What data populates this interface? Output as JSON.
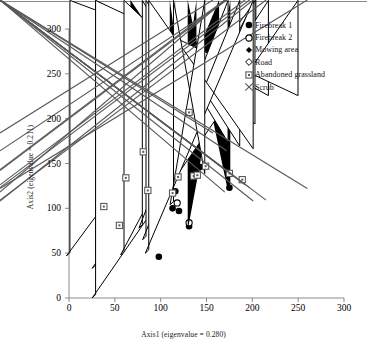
{
  "figure": {
    "background_color": "#ffffff",
    "frame_color": "#808080"
  },
  "axes": {
    "x": {
      "title": "Axis1 (eigenvalue = 0.280)",
      "ticks": [
        0,
        50,
        100,
        150,
        200,
        250,
        300
      ],
      "tick_labels": [
        "0",
        "50",
        "100",
        "150",
        "200",
        "250",
        "300"
      ],
      "range": [
        0,
        300
      ]
    },
    "y": {
      "title": "Axis2 (eigenvalue = 0.211)",
      "ticks": [
        0,
        50,
        100,
        150,
        200,
        250,
        300
      ],
      "tick_labels": [
        "0",
        "50",
        "100",
        "150",
        "200",
        "250",
        "300"
      ],
      "range": [
        0,
        300
      ]
    }
  },
  "legend": {
    "position": "top-right",
    "entries": [
      {
        "label": "Firebreak 1",
        "marker": "filled-circle"
      },
      {
        "label": "Firebreak 2",
        "marker": "open-circle"
      },
      {
        "label": "Mowing area",
        "marker": "filled-diamond"
      },
      {
        "label": "Road",
        "marker": "open-diamond"
      },
      {
        "label": "Abandoned grassland",
        "marker": "dotted-square"
      },
      {
        "label": "Scrub",
        "marker": "cross-x"
      }
    ]
  },
  "chart_data": {
    "type": "scatter",
    "title": "",
    "xlabel": "Axis1 (eigenvalue = 0.280)",
    "ylabel": "Axis2 (eigenvalue = 0.211)",
    "xlim": [
      0,
      300
    ],
    "ylim": [
      0,
      300
    ],
    "grid": false,
    "legend_position": "top-right",
    "series": [
      {
        "name": "Firebreak 1",
        "marker": "filled-circle",
        "color": "#000000",
        "points": [
          [
            28,
            242
          ],
          [
            31,
            139
          ],
          [
            39,
            143
          ],
          [
            50,
            164
          ],
          [
            51,
            140
          ],
          [
            64,
            151
          ],
          [
            65,
            147
          ],
          [
            66,
            143
          ],
          [
            75,
            138
          ],
          [
            87,
            173
          ],
          [
            88,
            165
          ],
          [
            98,
            46
          ],
          [
            116,
            119
          ],
          [
            113,
            100
          ],
          [
            120,
            97
          ],
          [
            131,
            80
          ],
          [
            140,
            144
          ],
          [
            143,
            146
          ],
          [
            175,
            123
          ]
        ]
      },
      {
        "name": "Firebreak 2",
        "marker": "open-circle",
        "color": "#000000",
        "points": [
          [
            64,
            175
          ],
          [
            66,
            168
          ],
          [
            67,
            159
          ],
          [
            82,
            154
          ],
          [
            80,
            123
          ],
          [
            87,
            135
          ],
          [
            97,
            189
          ],
          [
            99,
            172
          ],
          [
            97,
            135
          ],
          [
            130,
            186
          ],
          [
            118,
            106
          ],
          [
            131,
            84
          ]
        ]
      },
      {
        "name": "Mowing area",
        "marker": "filled-diamond",
        "color": "#000000",
        "points": [
          [
            67,
            88
          ],
          [
            111,
            137
          ],
          [
            139,
            143
          ],
          [
            176,
            123
          ]
        ]
      },
      {
        "name": "Road",
        "marker": "open-diamond",
        "color": "#000000",
        "points": [
          [
            1,
            47
          ],
          [
            29,
            33
          ],
          [
            29,
            0
          ],
          [
            60,
            48
          ],
          [
            80,
            78
          ],
          [
            84,
            65
          ],
          [
            87,
            50
          ],
          [
            114,
            104
          ]
        ]
      },
      {
        "name": "Abandoned grassland",
        "marker": "dotted-square",
        "color": "#595959",
        "points": [
          [
            38,
            102
          ],
          [
            55,
            81
          ],
          [
            62,
            134
          ],
          [
            81,
            163
          ],
          [
            86,
            120
          ],
          [
            113,
            117
          ],
          [
            119,
            135
          ],
          [
            131,
            207
          ],
          [
            136,
            136
          ],
          [
            140,
            137
          ],
          [
            149,
            147
          ],
          [
            175,
            139
          ],
          [
            189,
            132
          ]
        ]
      },
      {
        "name": "Scrub",
        "marker": "cross-x",
        "color": "#595959",
        "points": [
          [
            161,
            180
          ],
          [
            176,
            160
          ],
          [
            174,
            139
          ],
          [
            176,
            138
          ],
          [
            174,
            114
          ],
          [
            196,
            122
          ],
          [
            201,
            119
          ],
          [
            205,
            104
          ],
          [
            219,
            105
          ],
          [
            264,
            118
          ]
        ]
      }
    ]
  }
}
